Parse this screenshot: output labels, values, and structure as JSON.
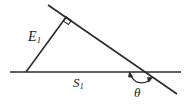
{
  "figure": {
    "background_color": "#ffffff",
    "stroke_color": "#2b2b2b",
    "labels": {
      "hypotenuse_leg": {
        "symbol": "E",
        "subscript": "1",
        "full": "E1"
      },
      "base": {
        "symbol": "S",
        "subscript": "1",
        "full": "S1"
      },
      "angle": {
        "symbol": "θ",
        "full": "θ"
      }
    },
    "markers": {
      "right_angle": "right-angle-square",
      "angle_arc": "double-headed-arc"
    },
    "geometry": {
      "baseline": {
        "x1": 10,
        "y1": 72,
        "x2": 181,
        "y2": 72
      },
      "slant_line": {
        "x1": 48,
        "y1": 5,
        "x2": 177,
        "y2": 94
      },
      "leg_line": {
        "x1": 26,
        "y1": 72,
        "x2": 66,
        "y2": 17
      },
      "vertex_apex": {
        "x": 66,
        "y": 17
      },
      "vertex_left": {
        "x": 26,
        "y": 72
      },
      "vertex_cross": {
        "x": 147,
        "y": 72
      },
      "angle_degrees": 35
    }
  }
}
